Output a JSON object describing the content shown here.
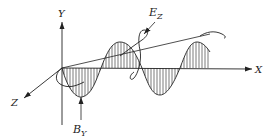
{
  "figure": {
    "type": "electromagnetic-wave-diagram",
    "axes": {
      "x": "X",
      "y": "Y",
      "z": "Z"
    },
    "wave_labels": {
      "electric": {
        "main": "E",
        "sub": "Z"
      },
      "magnetic": {
        "main": "B",
        "sub": "Y"
      }
    },
    "colors": {
      "ink": "#222222",
      "background": "#ffffff"
    }
  }
}
